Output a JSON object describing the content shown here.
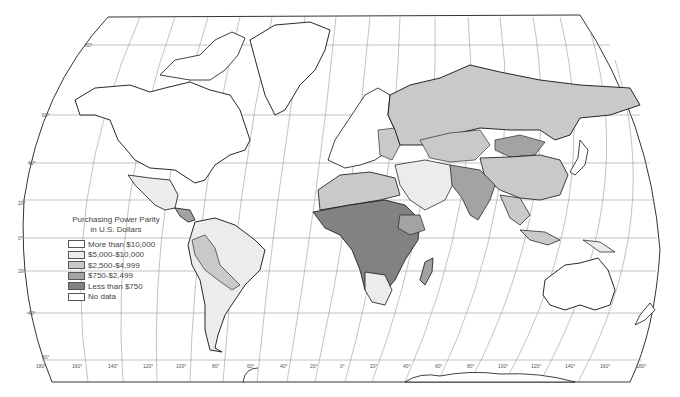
{
  "map": {
    "projection": "Robinson-style world map",
    "legend": {
      "title_line1": "Purchasing Power Parity",
      "title_line2": "in U.S. Dollars",
      "items": [
        {
          "label": "More than $10,000",
          "color": "#ffffff"
        },
        {
          "label": "$5,000-$10,000",
          "color": "#ececec"
        },
        {
          "label": "$2,500-$4,999",
          "color": "#c9c9c9"
        },
        {
          "label": "$750-$2,499",
          "color": "#a3a3a3"
        },
        {
          "label": "Less than $750",
          "color": "#828282"
        },
        {
          "label": "No data",
          "color": "#ffffff"
        }
      ]
    },
    "latitude_labels": [
      "80°",
      "60°",
      "40°",
      "20°",
      "0°",
      "20°",
      "40°",
      "60°"
    ],
    "longitude_labels": [
      "180°",
      "160°",
      "140°",
      "120°",
      "100°",
      "80°",
      "60°",
      "40°",
      "20°",
      "0°",
      "20°",
      "40°",
      "60°",
      "80°",
      "100°",
      "120°",
      "140°",
      "160°",
      "180°"
    ],
    "colors": {
      "frame": "#333333",
      "graticule": "#9a9a9a",
      "coast": "#111111",
      "land_white": "#ffffff",
      "land_light": "#ececec",
      "land_mid": "#c9c9c9",
      "land_dark": "#a3a3a3",
      "land_darkest": "#828282"
    }
  }
}
